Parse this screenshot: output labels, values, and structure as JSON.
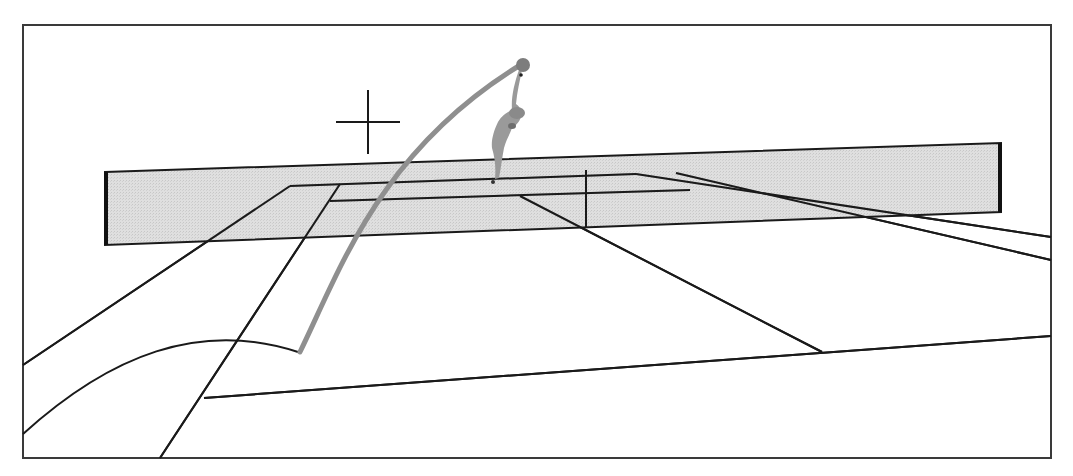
{
  "canvas": {
    "width": 1073,
    "height": 476,
    "background": "#ffffff"
  },
  "colors": {
    "line": "#1a1a1a",
    "net_fill": "#d6d6d6",
    "net_post": "#111111",
    "trajectory": "#8f8f8f",
    "figure": "#9a9a9a",
    "figure_dark": "#6e6e6e"
  },
  "frame": {
    "x": 23,
    "y": 25,
    "width": 1028,
    "height": 433
  },
  "crosshair": {
    "cx": 368,
    "cy": 122,
    "arm": 32
  },
  "net": {
    "points": "105,172 1001,143 1001,212 105,245",
    "left_post": {
      "x": 106,
      "y1": 172,
      "y2": 245
    },
    "right_post": {
      "x": 1000,
      "y1": 143,
      "y2": 212
    }
  },
  "court_lines": [
    {
      "name": "far-baseline-left",
      "d": "M290,186 L636,174"
    },
    {
      "name": "far-service-line",
      "d": "M330,201 L690,190"
    },
    {
      "name": "far-singles-sideline-left",
      "d": "M23,365 L290,186"
    },
    {
      "name": "far-doubles-sideline-left",
      "d": "M160,458 L340,184"
    },
    {
      "name": "center-service-line",
      "d": "M586,170 L586,228"
    },
    {
      "name": "near-center-diagonal",
      "d": "M520,196 L822,352"
    },
    {
      "name": "far-right-sideline-1",
      "d": "M636,174 L1051,237"
    },
    {
      "name": "far-right-sideline-2",
      "d": "M676,173 L1051,260"
    },
    {
      "name": "near-baseline",
      "d": "M204,398 L1051,336"
    }
  ],
  "curves": [
    {
      "name": "service-arc",
      "d": "M23,434 C110,355 200,320 298,352"
    }
  ],
  "trajectory": {
    "d": "M300,352 C340,270 380,150 522,64",
    "width": 5
  },
  "ball": {
    "cx": 523,
    "cy": 65,
    "r": 7
  },
  "figure": {
    "label": "server-figure"
  }
}
